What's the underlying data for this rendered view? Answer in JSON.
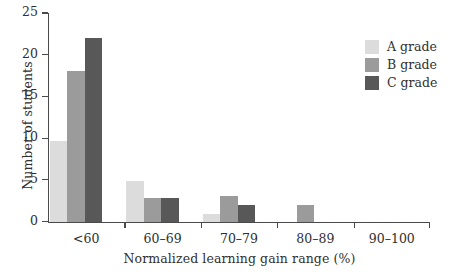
{
  "chart_data": {
    "type": "bar",
    "title": "",
    "subtitle": "",
    "xlabel": "Normalized learning gain range (%)",
    "ylabel": "Number of students",
    "categories": [
      "<60",
      "60–69",
      "70–79",
      "80–89",
      "90–100"
    ],
    "series": [
      {
        "name": "A grade",
        "color": "#dcdcdc",
        "values": [
          9.6,
          4.8,
          0.9,
          0,
          0
        ]
      },
      {
        "name": "B grade",
        "color": "#9b9b9b",
        "values": [
          18,
          2.8,
          3,
          2,
          0
        ]
      },
      {
        "name": "C grade",
        "color": "#585858",
        "values": [
          22,
          2.8,
          2,
          0,
          0
        ]
      }
    ],
    "ylim": [
      0,
      25
    ],
    "yticks": [
      0,
      5,
      10,
      15,
      20,
      25
    ],
    "ytick_labels": [
      "0",
      "5",
      "10",
      "15",
      "20",
      "25"
    ],
    "grid": false,
    "legend_position": "top-right",
    "axis_color": "#4a4a4a",
    "background": "#ffffff"
  },
  "legend": {
    "entries": [
      {
        "label": "A grade",
        "color": "#dcdcdc"
      },
      {
        "label": "B grade",
        "color": "#9b9b9b"
      },
      {
        "label": "C grade",
        "color": "#585858"
      }
    ]
  }
}
